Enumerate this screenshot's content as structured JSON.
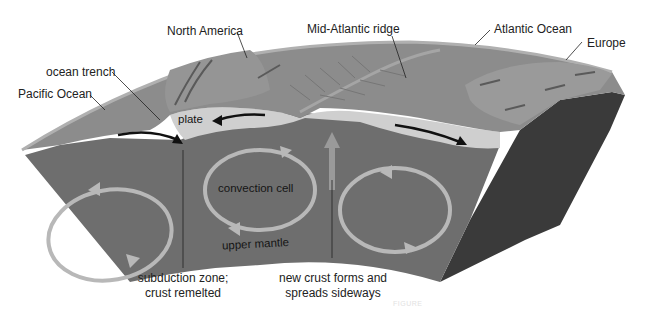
{
  "figure": {
    "labels": {
      "north_america": "North America",
      "mid_atlantic_ridge": "Mid-Atlantic ridge",
      "atlantic_ocean": "Atlantic Ocean",
      "europe": "Europe",
      "ocean_trench": "ocean trench",
      "pacific_ocean": "Pacific Ocean",
      "plate": "plate",
      "convection_cell": "convection cell",
      "upper_mantle": "upper mantle",
      "subduction_line1": "subduction zone;",
      "subduction_line2": "crust remelted",
      "new_crust_line1": "new crust forms and",
      "new_crust_line2": "spreads sideways"
    },
    "caption_faded": "FIGURE",
    "colors": {
      "surface": "#8c8c8c",
      "surface_edge": "#a8a8a8",
      "plate": "#cfcfcf",
      "mantle": "#6e6e6e",
      "mantle_dark_side": "#3a3a3a",
      "convection_arrow": "#b8b8b8",
      "black_arrow": "#111111",
      "text": "#222222"
    }
  }
}
